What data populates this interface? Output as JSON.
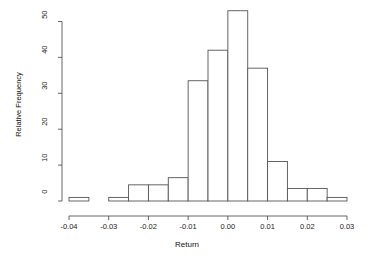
{
  "chart_data": {
    "type": "bar",
    "title": "",
    "subtitle": "",
    "xlabel": "Return",
    "ylabel": "Relative Frequency",
    "xlim": [
      -0.04,
      0.03
    ],
    "ylim": [
      0,
      53
    ],
    "grid": false,
    "legend": null,
    "bin_width": 0.005,
    "bin_edges": [
      -0.04,
      -0.035,
      -0.03,
      -0.025,
      -0.02,
      -0.015,
      -0.01,
      -0.005,
      0.0,
      0.005,
      0.01,
      0.015,
      0.02,
      0.025,
      0.03
    ],
    "categories": [
      "-0.040 to -0.035",
      "-0.035 to -0.030",
      "-0.030 to -0.025",
      "-0.025 to -0.020",
      "-0.020 to -0.015",
      "-0.015 to -0.010",
      "-0.010 to -0.005",
      "-0.005 to 0.000",
      "0.000 to 0.005",
      "0.005 to 0.010",
      "0.010 to 0.015",
      "0.015 to 0.020",
      "0.020 to 0.025",
      "0.025 to 0.030"
    ],
    "values": [
      1,
      0,
      1,
      4.5,
      4.5,
      6.5,
      33.5,
      42,
      53,
      37,
      11,
      3.5,
      3.5,
      1
    ],
    "xticks": [
      -0.04,
      -0.03,
      -0.02,
      -0.01,
      0.0,
      0.01,
      0.02,
      0.03
    ],
    "xtick_labels": [
      "-0.04",
      "-0.03",
      "-0.02",
      "-0.01",
      "0.00",
      "0.01",
      "0.02",
      "0.03"
    ],
    "yticks": [
      0,
      10,
      20,
      30,
      40,
      50
    ],
    "ytick_labels": [
      "0",
      "10",
      "20",
      "30",
      "40",
      "50"
    ],
    "bar_fill": "#ffffff",
    "bar_stroke": "#555555",
    "axis_color": "#555555",
    "text_color": "#111111",
    "background": "#ffffff"
  }
}
